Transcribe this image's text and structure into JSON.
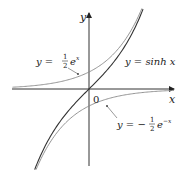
{
  "chart_data": {
    "type": "line",
    "title": "",
    "xlabel": "x",
    "ylabel": "y",
    "origin_label": "0",
    "xlim": [
      -2.3,
      2.5
    ],
    "ylim": [
      -2.2,
      2.2
    ],
    "grid": false,
    "legend": "inline annotations",
    "series": [
      {
        "name": "y = sinh x",
        "formula": "sinh(x)",
        "color": "#333333",
        "label_parts": [
          "y = sinh ",
          "x"
        ]
      },
      {
        "name": "y = 1/2 e^x",
        "formula": "0.5*exp(x)",
        "color": "#777777",
        "label_parts": [
          "y = ",
          "1",
          "2",
          "e",
          "x"
        ]
      },
      {
        "name": "y = -1/2 e^-x",
        "formula": "-0.5*exp(-x)",
        "color": "#777777",
        "label_parts": [
          "y = −",
          "1",
          "2",
          "e",
          "−x"
        ]
      }
    ]
  }
}
